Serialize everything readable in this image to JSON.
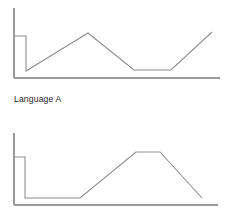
{
  "figure": {
    "background_color": "#ffffff",
    "axis_color": "#9a9a9a",
    "line_color": "#8d8d8d",
    "caption": "Language A"
  },
  "chart_data": [
    {
      "type": "line",
      "name": "top-panel",
      "title": "",
      "xlabel": "",
      "ylabel": "",
      "grid": false,
      "legend": "none",
      "axes": {
        "y_axis": {
          "x": 14,
          "y_top": 8,
          "y_bottom": 78
        },
        "x_axis": {
          "y": 78,
          "x_left": 14,
          "x_right": 220
        }
      },
      "xlim": [
        14,
        220
      ],
      "ylim": [
        78,
        8
      ],
      "series": [
        {
          "name": "contour",
          "points": [
            [
              14,
              36
            ],
            [
              26,
              36
            ],
            [
              26,
              71
            ],
            [
              88,
              33
            ],
            [
              134,
              70
            ],
            [
              171,
              70
            ],
            [
              212,
              32
            ]
          ]
        }
      ]
    },
    {
      "type": "line",
      "name": "bottom-panel",
      "title": "",
      "xlabel": "",
      "ylabel": "",
      "grid": false,
      "legend": "none",
      "axes": {
        "y_axis": {
          "x": 14,
          "y_top": 133,
          "y_bottom": 205
        },
        "x_axis": {
          "y": 205,
          "x_left": 14,
          "x_right": 218
        }
      },
      "xlim": [
        14,
        218
      ],
      "ylim": [
        205,
        133
      ],
      "series": [
        {
          "name": "contour",
          "points": [
            [
              14,
              157
            ],
            [
              25,
              157
            ],
            [
              25,
              198
            ],
            [
              80,
              198
            ],
            [
              136,
              152
            ],
            [
              160,
              152
            ],
            [
              202,
              198
            ]
          ]
        }
      ]
    }
  ]
}
